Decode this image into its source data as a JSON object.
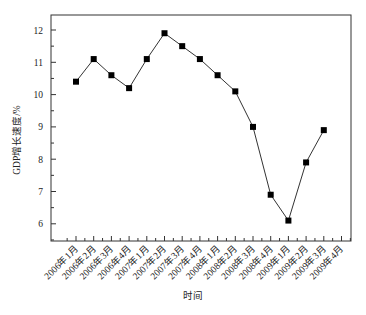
{
  "chart_data": {
    "type": "line",
    "title": "",
    "xlabel": "时间",
    "ylabel": "GDP增长速度/%",
    "categories": [
      "2006年1月",
      "2006年2月",
      "2006年3月",
      "2006年4月",
      "2007年1月",
      "2007年2月",
      "2007年3月",
      "2007年4月",
      "2008年1月",
      "2008年2月",
      "2008年3月",
      "2008年4月",
      "2009年1月",
      "2009年2月",
      "2009年3月",
      "2009年4月"
    ],
    "series": [
      {
        "name": "GDP增长速度",
        "marker": "filled-square",
        "color": "#000000",
        "values": [
          10.4,
          11.1,
          10.6,
          10.2,
          11.1,
          11.9,
          11.5,
          11.1,
          10.6,
          10.1,
          9.0,
          6.9,
          6.1,
          7.9,
          8.9,
          null
        ]
      }
    ],
    "yticks": [
      6,
      7,
      8,
      9,
      10,
      11,
      12
    ],
    "ylim": [
      5.47,
      12.46
    ],
    "grid": false,
    "legend": "none"
  }
}
